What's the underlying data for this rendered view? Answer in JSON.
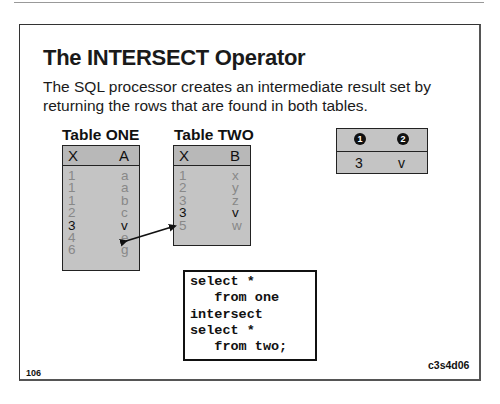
{
  "slide": {
    "title": "The INTERSECT Operator",
    "subtitle": "The SQL processor creates an intermediate result set by returning the rows that are found in both tables.",
    "page_number": "106",
    "slide_code": "c3s4d06"
  },
  "table_one": {
    "label": "Table ONE",
    "columns": [
      "X",
      "A"
    ],
    "rows": [
      [
        "1",
        "a"
      ],
      [
        "1",
        "a"
      ],
      [
        "1",
        "b"
      ],
      [
        "2",
        "c"
      ],
      [
        "3",
        "v"
      ],
      [
        "4",
        "e"
      ],
      [
        "6",
        "g"
      ]
    ],
    "highlighted_row": 4
  },
  "table_two": {
    "label": "Table TWO",
    "columns": [
      "X",
      "B"
    ],
    "rows": [
      [
        "1",
        "x"
      ],
      [
        "2",
        "y"
      ],
      [
        "3",
        "z"
      ],
      [
        "3",
        "v"
      ],
      [
        "5",
        "w"
      ]
    ],
    "highlighted_row": 3
  },
  "result": {
    "columns": [
      "1",
      "2"
    ],
    "column_icons": [
      "circled-1-icon",
      "circled-2-icon"
    ],
    "rows": [
      [
        "3",
        "v"
      ]
    ]
  },
  "code": {
    "lines": [
      "select *",
      "   from one",
      "intersect",
      "select *",
      "   from two;"
    ]
  },
  "colors": {
    "table_fill": "#c4c4c4",
    "dim_text": "#888888",
    "text": "#111111"
  }
}
